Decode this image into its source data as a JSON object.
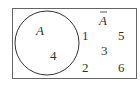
{
  "diagram": {
    "type": "venn",
    "universe_border_color": "#555555",
    "circle_color": "#333333",
    "set": {
      "label": "A",
      "elements": [
        "4"
      ]
    },
    "complement": {
      "label": "A",
      "overline": true,
      "elements": [
        "1",
        "5",
        "3",
        "2",
        "6"
      ]
    }
  }
}
